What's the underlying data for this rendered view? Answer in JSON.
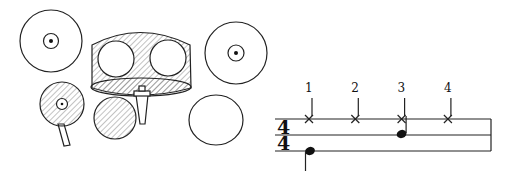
{
  "figure": {
    "kit": {
      "pieces": [
        {
          "id": "crash-cymbal",
          "label": "Crash cymbal",
          "highlighted": false
        },
        {
          "id": "hihat",
          "label": "Hi-hat",
          "highlighted": true
        },
        {
          "id": "bass-drum",
          "label": "Bass drum (with toms)",
          "highlighted": true
        },
        {
          "id": "snare-drum",
          "label": "Snare drum",
          "highlighted": true
        },
        {
          "id": "ride-cymbal",
          "label": "Ride cymbal",
          "highlighted": false
        },
        {
          "id": "floor-tom",
          "label": "Floor tom",
          "highlighted": false
        }
      ],
      "hatch_color": "#555555"
    },
    "notation": {
      "time_signature": {
        "top": "4",
        "bottom": "4"
      },
      "counts": [
        "1",
        "2",
        "3",
        "4"
      ],
      "hihat_beats": [
        1,
        2,
        3,
        4
      ],
      "snare_beats": [
        3
      ],
      "bass_beats": [
        1
      ]
    }
  }
}
